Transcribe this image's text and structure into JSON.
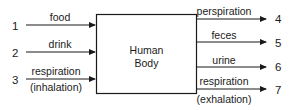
{
  "diagram": {
    "center_box": {
      "line1": "Human",
      "line2": "Body"
    },
    "inputs": [
      {
        "number": "1",
        "label": "food",
        "sublabel": ""
      },
      {
        "number": "2",
        "label": "drink",
        "sublabel": ""
      },
      {
        "number": "3",
        "label": "respiration",
        "sublabel": "(inhalation)"
      }
    ],
    "outputs": [
      {
        "number": "4",
        "label": "perspiration",
        "sublabel": ""
      },
      {
        "number": "5",
        "label": "feces",
        "sublabel": ""
      },
      {
        "number": "6",
        "label": "urine",
        "sublabel": ""
      },
      {
        "number": "7",
        "label": "respiration",
        "sublabel": "(exhalation)"
      }
    ],
    "colors": {
      "stroke": "#1a1a1a",
      "background": "#ffffff"
    }
  }
}
